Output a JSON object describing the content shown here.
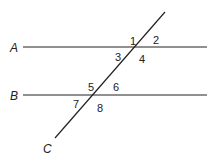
{
  "diagram": {
    "line_color": "#222222",
    "lines": [
      {
        "id": "A",
        "label": "A",
        "x1": 23,
        "y1": 47,
        "x2": 207,
        "y2": 47
      },
      {
        "id": "B",
        "label": "B",
        "x1": 23,
        "y1": 95,
        "x2": 207,
        "y2": 95
      },
      {
        "id": "C",
        "label": "C",
        "x1": 165,
        "y1": 12,
        "x2": 55,
        "y2": 138
      }
    ],
    "angles": [
      {
        "label": "1",
        "x": 130,
        "y": 45
      },
      {
        "label": "2",
        "x": 153,
        "y": 44
      },
      {
        "label": "3",
        "x": 115,
        "y": 61
      },
      {
        "label": "4",
        "x": 139,
        "y": 63
      },
      {
        "label": "5",
        "x": 88,
        "y": 91
      },
      {
        "label": "6",
        "x": 113,
        "y": 91
      },
      {
        "label": "7",
        "x": 73,
        "y": 108
      },
      {
        "label": "8",
        "x": 97,
        "y": 112
      }
    ],
    "line_labels": [
      {
        "label": "A",
        "x": 10,
        "y": 52
      },
      {
        "label": "B",
        "x": 10,
        "y": 100
      },
      {
        "label": "C",
        "x": 43,
        "y": 153
      }
    ]
  }
}
